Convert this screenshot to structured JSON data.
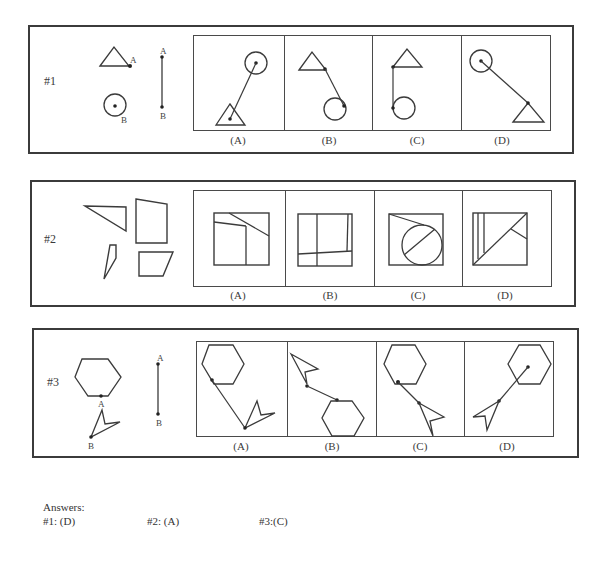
{
  "questions": [
    {
      "id": "q1",
      "label": "#1",
      "frame": {
        "x": 28,
        "y": 25,
        "w": 546,
        "h": 129
      },
      "label_pos": {
        "x": 44,
        "y": 75
      },
      "panels_box": {
        "x": 193,
        "y": 35,
        "w": 358,
        "h": 96
      },
      "options": [
        {
          "label": "(A)",
          "w": 91
        },
        {
          "label": "(B)",
          "w": 88
        },
        {
          "label": "(C)",
          "w": 89
        },
        {
          "label": "(D)",
          "w": 90
        }
      ],
      "labels_y": 134,
      "given_label_A": "A",
      "given_label_B": "B",
      "correct": "(D)"
    },
    {
      "id": "q2",
      "label": "#2",
      "frame": {
        "x": 30,
        "y": 180,
        "w": 546,
        "h": 127
      },
      "label_pos": {
        "x": 44,
        "y": 233
      },
      "panels_box": {
        "x": 193,
        "y": 190,
        "w": 359,
        "h": 97
      },
      "options": [
        {
          "label": "(A)",
          "w": 92
        },
        {
          "label": "(B)",
          "w": 89
        },
        {
          "label": "(C)",
          "w": 88
        },
        {
          "label": "(D)",
          "w": 90
        }
      ],
      "labels_y": 289,
      "correct": "(A)"
    },
    {
      "id": "q3",
      "label": "#3",
      "frame": {
        "x": 32,
        "y": 328,
        "w": 547,
        "h": 130
      },
      "label_pos": {
        "x": 47,
        "y": 376
      },
      "panels_box": {
        "x": 196,
        "y": 341,
        "w": 358,
        "h": 96
      },
      "options": [
        {
          "label": "(A)",
          "w": 91
        },
        {
          "label": "(B)",
          "w": 89
        },
        {
          "label": "(C)",
          "w": 88
        },
        {
          "label": "(D)",
          "w": 90
        }
      ],
      "labels_y": 440,
      "given_label_A": "A",
      "given_label_B": "B",
      "correct": "(C)"
    }
  ],
  "answers": {
    "heading": "Answers:",
    "items": [
      {
        "text": "#1: (D)"
      },
      {
        "text": "#2: (A)"
      },
      {
        "text": "#3:(C)"
      }
    ]
  },
  "colors": {
    "stroke": "#3b3b3b",
    "text": "#3a3a3a",
    "background": "#ffffff"
  }
}
